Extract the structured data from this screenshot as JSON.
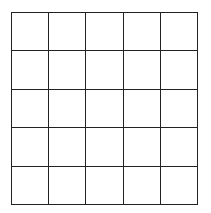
{
  "grid": {
    "rows": 5,
    "columns": 5,
    "line_color": "#222222",
    "cell_color": "#ffffff",
    "cells": [
      [
        "",
        "",
        "",
        "",
        ""
      ],
      [
        "",
        "",
        "",
        "",
        ""
      ],
      [
        "",
        "",
        "",
        "",
        ""
      ],
      [
        "",
        "",
        "",
        "",
        ""
      ],
      [
        "",
        "",
        "",
        "",
        ""
      ]
    ]
  }
}
